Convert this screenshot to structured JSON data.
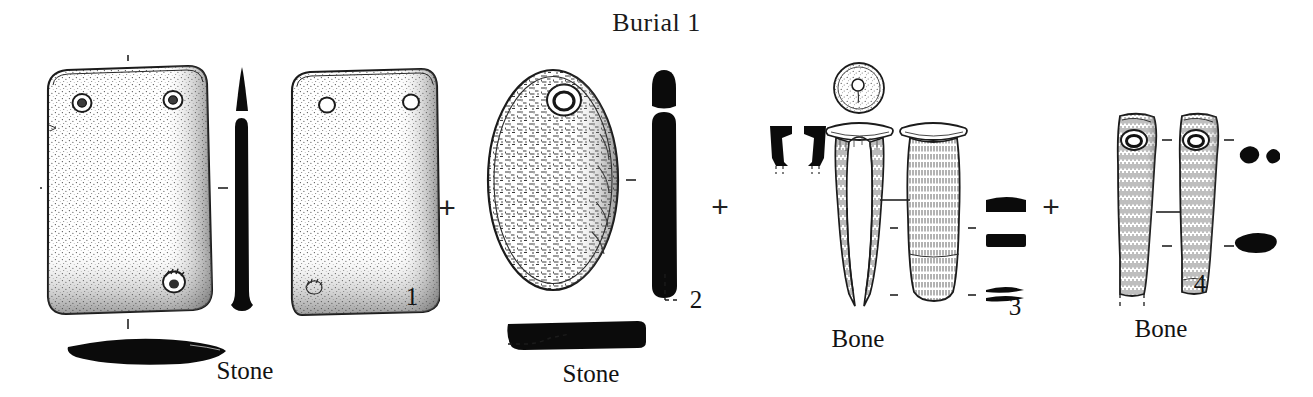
{
  "figure": {
    "title": "Burial 1",
    "separator": "+",
    "background_color": "#ffffff",
    "ink_color": "#111111"
  },
  "groups": [
    {
      "number": "1",
      "material": "Stone",
      "object": "perforated rectangular stone plaque",
      "views": [
        "front face",
        "side profile",
        "reverse face",
        "basal section"
      ],
      "perforations": 3
    },
    {
      "number": "2",
      "material": "Stone",
      "object": "perforated oval stone pendant",
      "views": [
        "front face",
        "side profile",
        "basal section"
      ],
      "perforations": 1
    },
    {
      "number": "3",
      "material": "Bone",
      "object": "flared bone tube",
      "views": [
        "top view",
        "split view",
        "side view",
        "rim profiles",
        "cross sections"
      ],
      "perforations": 1
    },
    {
      "number": "4",
      "material": "Bone",
      "object": "perforated bone implement",
      "views": [
        "face view",
        "reverse view",
        "cross sections"
      ],
      "perforations": 1
    }
  ],
  "labels": {
    "title": "Burial 1",
    "plus_1": "+",
    "plus_2": "+",
    "plus_3": "+",
    "stone_1": "Stone",
    "stone_2": "Stone",
    "bone_3": "Bone",
    "bone_4": "Bone",
    "num_1": "1",
    "num_2": "2",
    "num_3": "3",
    "num_4": "4"
  }
}
